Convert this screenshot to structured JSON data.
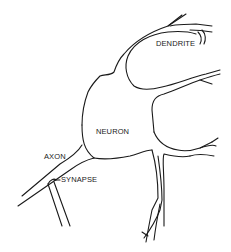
{
  "diagram": {
    "type": "neuron-illustration",
    "style": "black line drawing on white",
    "labels": {
      "dendrite": "DENDRITE",
      "neuron": "NEURON",
      "axon": "AXON",
      "synapse": "SYNAPSE"
    },
    "colors": {
      "line": "#1a1a1a",
      "background": "#ffffff"
    }
  }
}
